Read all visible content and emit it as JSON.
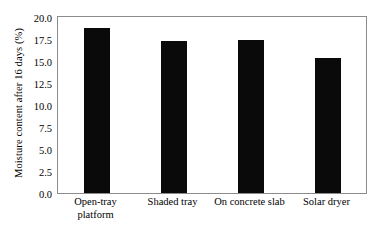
{
  "chart_data": {
    "type": "bar",
    "title": "",
    "subtitle": "",
    "xlabel": "",
    "ylabel": "Moisture content after 16 days (%)",
    "categories": [
      "Open-tray\nplatform",
      "Shaded tray",
      "On concrete slab",
      "Solar dryer"
    ],
    "values": [
      18.8,
      17.3,
      17.4,
      15.3
    ],
    "ylim": [
      0.0,
      20.0
    ],
    "ytick_labels": [
      "20.0",
      "17.5",
      "15.0",
      "12.5",
      "10.0",
      "7.5",
      "5.0",
      "2.5",
      "0.0"
    ],
    "ytick_values": [
      20.0,
      17.5,
      15.0,
      12.5,
      10.0,
      7.5,
      5.0,
      2.5,
      0.0
    ],
    "grid": false,
    "legend": null,
    "bar_color": "#0a0a0a",
    "frame_color": "#8c8c8c",
    "background_color": "#ffffff"
  }
}
